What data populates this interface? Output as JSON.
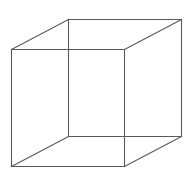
{
  "diagram": {
    "type": "necker-cube",
    "stroke_color": "#5a5a5a",
    "background": "#ffffff",
    "vertices": {
      "front_top_left": [
        11,
        49
      ],
      "front_top_right": [
        124,
        49
      ],
      "front_bottom_left": [
        11,
        166
      ],
      "front_bottom_right": [
        124,
        166
      ],
      "back_top_left": [
        68,
        19
      ],
      "back_top_right": [
        181,
        19
      ],
      "back_bottom_left": [
        68,
        136
      ],
      "back_bottom_right": [
        181,
        136
      ]
    },
    "edges": [
      [
        "front_top_left",
        "front_top_right"
      ],
      [
        "front_top_right",
        "front_bottom_right"
      ],
      [
        "front_bottom_right",
        "front_bottom_left"
      ],
      [
        "front_bottom_left",
        "front_top_left"
      ],
      [
        "back_top_left",
        "back_top_right"
      ],
      [
        "back_top_right",
        "back_bottom_right"
      ],
      [
        "back_bottom_right",
        "back_bottom_left"
      ],
      [
        "back_bottom_left",
        "back_top_left"
      ],
      [
        "front_top_left",
        "back_top_left"
      ],
      [
        "front_top_right",
        "back_top_right"
      ],
      [
        "front_bottom_left",
        "back_bottom_left"
      ],
      [
        "front_bottom_right",
        "back_bottom_right"
      ]
    ]
  }
}
